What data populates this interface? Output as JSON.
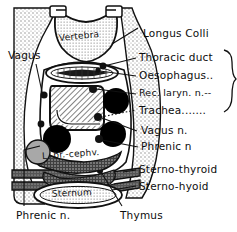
{
  "figure": {
    "type": "anatomical-cross-section",
    "region": "thoracic inlet / cranial mediastinum, transverse section"
  },
  "labels_right": [
    {
      "id": "longus-colli",
      "text": "Longus Colli",
      "x": 143,
      "y": 28,
      "braced": false
    },
    {
      "id": "thoracic-duct",
      "text": "Thoracic duct",
      "x": 139,
      "y": 59,
      "braced": true
    },
    {
      "id": "oesophagus",
      "text": "Oesophagus..",
      "x": 139,
      "y": 78,
      "braced": true
    },
    {
      "id": "rec-laryn-n",
      "text": "Rec. laryn. n.--",
      "x": 139,
      "y": 96,
      "braced": true
    },
    {
      "id": "trachea",
      "text": "Trachea.......",
      "x": 139,
      "y": 111,
      "braced": true
    },
    {
      "id": "vagus-n",
      "text": "Vagus n.",
      "x": 141,
      "y": 133,
      "braced": false
    },
    {
      "id": "phrenic-n-right",
      "text": "Phrenic n",
      "x": 141,
      "y": 149,
      "braced": false
    },
    {
      "id": "sterno-thyroid",
      "text": "Sterno-thyroid",
      "x": 139,
      "y": 172,
      "braced": false
    },
    {
      "id": "sterno-hyoid",
      "text": "Sterno-hyoid",
      "x": 139,
      "y": 188,
      "braced": false
    }
  ],
  "labels_left": [
    {
      "id": "vagus",
      "text": "Vagus",
      "x": 8,
      "y": 56
    }
  ],
  "labels_bottom": [
    {
      "id": "phrenic-n-left",
      "text": "Phrenic n.",
      "x": 16,
      "y": 214
    },
    {
      "id": "thymus",
      "text": "Thymus",
      "x": 120,
      "y": 214
    }
  ],
  "labels_in_figure": [
    {
      "id": "vertebra",
      "text": "Vertebra",
      "x": 59,
      "y": 32,
      "rotate": -6
    },
    {
      "id": "l-brachiocephalic",
      "text": "L. br.-cephv.",
      "x": 42,
      "y": 156,
      "rotate": -4
    },
    {
      "id": "sternum",
      "text": "Sternum",
      "x": 48,
      "y": 194,
      "rotate": -2
    }
  ],
  "colors": {
    "ink": "#0d0d0d",
    "stipple": "#9a9a9a",
    "vessel_fill": "#000000",
    "muscle_fill": "#4a4a4a",
    "vein_fill": "#a8a8a8",
    "paper": "#ffffff"
  }
}
